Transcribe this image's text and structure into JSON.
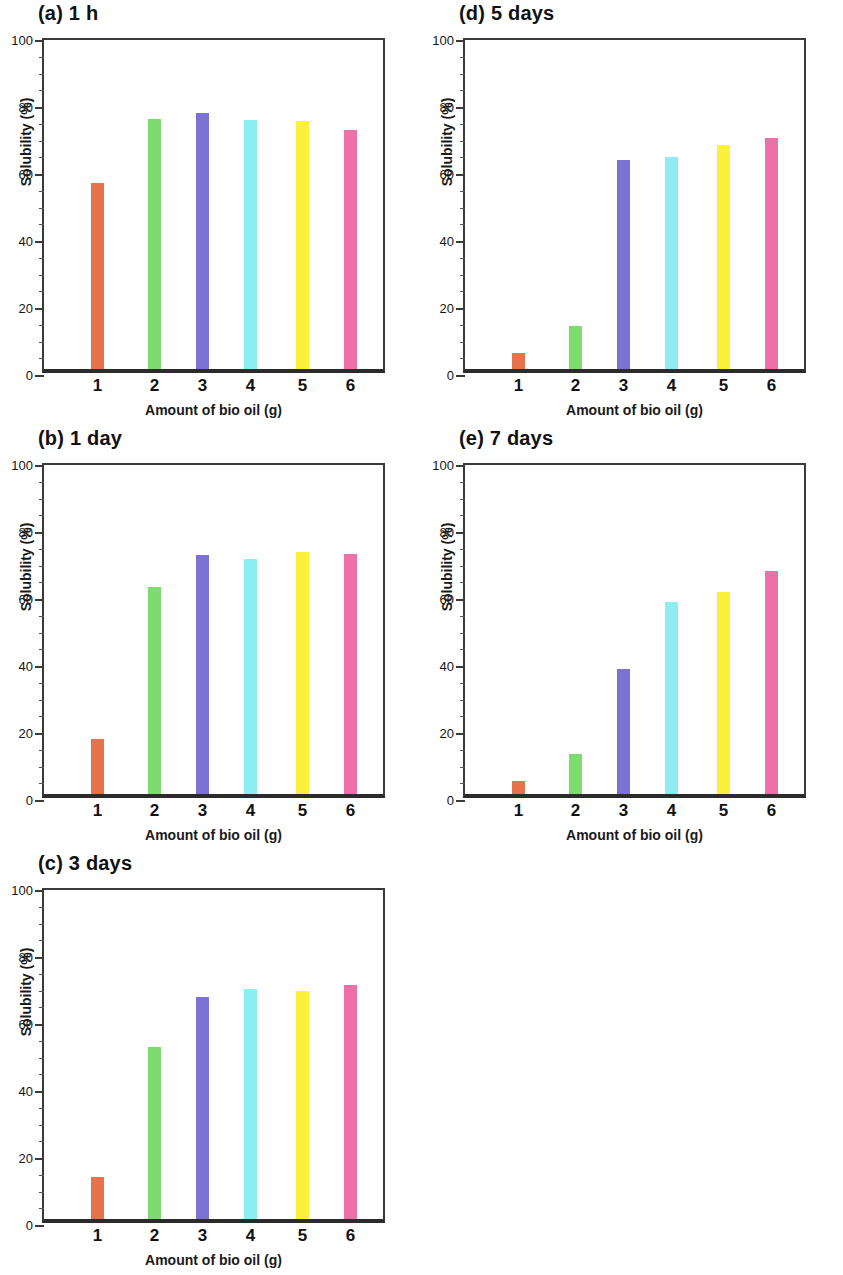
{
  "figure": {
    "axis_x_label": "Amount of bio oil (g)",
    "axis_y_label": "Solubility (%)",
    "y_ticks": [
      "0",
      "20",
      "40",
      "60",
      "80",
      "100"
    ],
    "x_ticks": [
      "1",
      "2",
      "3",
      "4",
      "5",
      "6"
    ]
  },
  "panels": [
    {
      "id": "a",
      "title": "(a) 1 h",
      "position": "top-left"
    },
    {
      "id": "b",
      "title": "(b) 1 day",
      "position": "middle-left"
    },
    {
      "id": "c",
      "title": "(c) 3 days",
      "position": "bottom-left"
    },
    {
      "id": "d",
      "title": "(d) 5 days",
      "position": "top-right"
    },
    {
      "id": "e",
      "title": "(e) 7 days",
      "position": "middle-right"
    }
  ],
  "colors": {
    "bar_1": "#e8734a",
    "bar_2": "#7ddc6e",
    "bar_3": "#7b72d4",
    "bar_4": "#8ceef0",
    "bar_5": "#fdf03a",
    "bar_6": "#ef6fa8",
    "axis": "#3a3a3a",
    "baseline": "#2b2b2b",
    "text": "#111111"
  },
  "chart_data": [
    {
      "type": "bar",
      "title": "(a) 1 h",
      "xlabel": "Amount of bio oil (g)",
      "ylabel": "Solubility (%)",
      "categories": [
        "1",
        "2",
        "3",
        "4",
        "5",
        "6"
      ],
      "values": [
        55.5,
        74.7,
        76.3,
        74.2,
        74.0,
        71.4
      ],
      "ylim": [
        0,
        100
      ],
      "yticks": [
        0,
        20,
        40,
        60,
        80,
        100
      ],
      "grid": false,
      "legend": "none",
      "colors": [
        "#e8734a",
        "#7ddc6e",
        "#7b72d4",
        "#8ceef0",
        "#fdf03a",
        "#ef6fa8"
      ]
    },
    {
      "type": "bar",
      "title": "(b) 1 day",
      "xlabel": "Amount of bio oil (g)",
      "ylabel": "Solubility (%)",
      "categories": [
        "1",
        "2",
        "3",
        "4",
        "5",
        "6"
      ],
      "values": [
        16.4,
        61.8,
        71.3,
        70.1,
        72.3,
        71.7
      ],
      "ylim": [
        0,
        100
      ],
      "yticks": [
        0,
        20,
        40,
        60,
        80,
        100
      ],
      "grid": false,
      "legend": "none",
      "colors": [
        "#e8734a",
        "#7ddc6e",
        "#7b72d4",
        "#8ceef0",
        "#fdf03a",
        "#ef6fa8"
      ]
    },
    {
      "type": "bar",
      "title": "(c) 3 days",
      "xlabel": "Amount of bio oil (g)",
      "ylabel": "Solubility (%)",
      "categories": [
        "1",
        "2",
        "3",
        "4",
        "5",
        "6"
      ],
      "values": [
        12.6,
        51.2,
        66.2,
        68.8,
        68.0,
        69.9
      ],
      "ylim": [
        0,
        100
      ],
      "yticks": [
        0,
        20,
        40,
        60,
        80,
        100
      ],
      "grid": false,
      "legend": "none",
      "colors": [
        "#e8734a",
        "#7ddc6e",
        "#7b72d4",
        "#8ceef0",
        "#fdf03a",
        "#ef6fa8"
      ]
    },
    {
      "type": "bar",
      "title": "(d) 5 days",
      "xlabel": "Amount of bio oil (g)",
      "ylabel": "Solubility (%)",
      "categories": [
        "1",
        "2",
        "3",
        "4",
        "5",
        "6"
      ],
      "values": [
        4.7,
        12.9,
        62.4,
        63.3,
        66.8,
        69.1
      ],
      "ylim": [
        0,
        100
      ],
      "yticks": [
        0,
        20,
        40,
        60,
        80,
        100
      ],
      "grid": false,
      "legend": "none",
      "colors": [
        "#e8734a",
        "#7ddc6e",
        "#7b72d4",
        "#8ceef0",
        "#fdf03a",
        "#ef6fa8"
      ]
    },
    {
      "type": "bar",
      "title": "(e) 7 days",
      "xlabel": "Amount of bio oil (g)",
      "ylabel": "Solubility (%)",
      "categories": [
        "1",
        "2",
        "3",
        "4",
        "5",
        "6"
      ],
      "values": [
        3.9,
        11.8,
        37.3,
        57.4,
        60.3,
        66.5
      ],
      "ylim": [
        0,
        100
      ],
      "yticks": [
        0,
        20,
        40,
        60,
        80,
        100
      ],
      "grid": false,
      "legend": "none",
      "colors": [
        "#e8734a",
        "#7ddc6e",
        "#7b72d4",
        "#8ceef0",
        "#fdf03a",
        "#ef6fa8"
      ]
    }
  ]
}
